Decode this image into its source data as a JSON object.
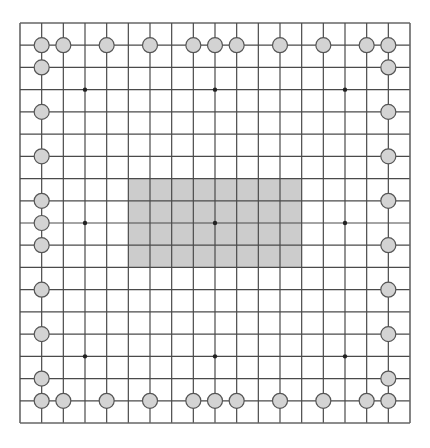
{
  "board": {
    "size": 19,
    "origin_x": 20,
    "origin_y": 23,
    "width": 390,
    "height": 400,
    "line_color": "#4a4a4a",
    "border_color": "#666666",
    "background": "#ffffff",
    "star_points": [
      [
        3,
        3
      ],
      [
        9,
        3
      ],
      [
        15,
        3
      ],
      [
        3,
        9
      ],
      [
        9,
        9
      ],
      [
        15,
        9
      ],
      [
        3,
        15
      ],
      [
        9,
        15
      ],
      [
        15,
        15
      ]
    ],
    "star_color": "#222222"
  },
  "highlight_region": {
    "col_start": 5,
    "col_end": 13,
    "row_start": 7,
    "row_end": 11,
    "color": "#cccccc"
  },
  "stone_style": {
    "fill": "#d3d3d3",
    "stroke": "#555555",
    "radius": 7.5
  },
  "stones": [
    [
      1,
      1
    ],
    [
      2,
      1
    ],
    [
      4,
      1
    ],
    [
      6,
      1
    ],
    [
      8,
      1
    ],
    [
      9,
      1
    ],
    [
      10,
      1
    ],
    [
      12,
      1
    ],
    [
      14,
      1
    ],
    [
      16,
      1
    ],
    [
      17,
      1
    ],
    [
      1,
      2
    ],
    [
      1,
      4
    ],
    [
      1,
      6
    ],
    [
      1,
      8
    ],
    [
      1,
      9
    ],
    [
      1,
      10
    ],
    [
      1,
      12
    ],
    [
      1,
      14
    ],
    [
      1,
      16
    ],
    [
      1,
      17
    ],
    [
      17,
      2
    ],
    [
      17,
      4
    ],
    [
      17,
      6
    ],
    [
      17,
      8
    ],
    [
      17,
      10
    ],
    [
      17,
      12
    ],
    [
      17,
      14
    ],
    [
      17,
      16
    ],
    [
      17,
      17
    ],
    [
      2,
      17
    ],
    [
      4,
      17
    ],
    [
      6,
      17
    ],
    [
      8,
      17
    ],
    [
      9,
      17
    ],
    [
      10,
      17
    ],
    [
      12,
      17
    ],
    [
      14,
      17
    ],
    [
      16,
      17
    ]
  ]
}
